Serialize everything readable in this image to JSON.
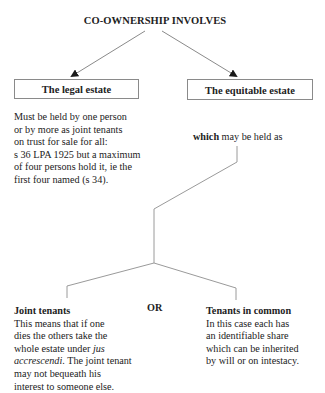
{
  "title": "CO-OWNERSHIP INVOLVES",
  "boxes": {
    "legal": "The legal estate",
    "equitable": "The equitable estate"
  },
  "legal_description": [
    "Must be held by one person",
    "or by more as joint tenants",
    "on trust for sale for all:",
    "s 36 LPA 1925 but a maximum",
    "of four persons hold it, ie the",
    "first four named (s 34)."
  ],
  "equitable_note": {
    "bold": "which",
    "rest": " may be held as"
  },
  "or_label": "OR",
  "joint_tenants": {
    "heading": "Joint tenants",
    "line1": "This means that if one",
    "line2": "dies the others take the",
    "line3_pre": "whole estate under ",
    "line3_italic": "jus",
    "line4_italic": "accrescendi",
    "line4_post": ". The joint tenant",
    "line5": "may not bequeath his",
    "line6": "interest to someone else."
  },
  "tenants_in_common": {
    "heading": "Tenants in common",
    "lines": [
      "In this case each has",
      "an identifiable share",
      "which can be inherited",
      "by will or on intestacy."
    ]
  },
  "colors": {
    "line": "#8a8a8a",
    "text": "#222222",
    "arrow": "#1a1a1a"
  }
}
